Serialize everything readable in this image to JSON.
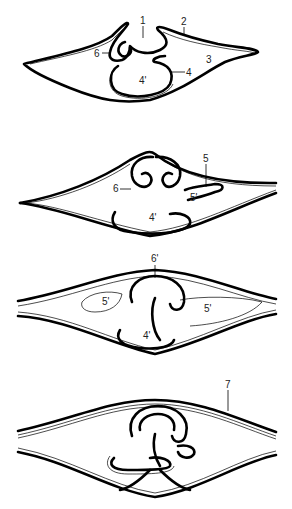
{
  "figure": {
    "panels": [
      {
        "id": "stage-1",
        "labels": [
          {
            "text": "1",
            "x": 142,
            "y": 24
          },
          {
            "text": "2",
            "x": 182,
            "y": 25
          },
          {
            "text": "3",
            "x": 206,
            "y": 63
          },
          {
            "text": "4",
            "x": 186,
            "y": 76
          },
          {
            "text": "4'",
            "x": 140,
            "y": 83
          },
          {
            "text": "6",
            "x": 95,
            "y": 57
          }
        ]
      },
      {
        "id": "stage-2",
        "labels": [
          {
            "text": "5",
            "x": 203,
            "y": 162
          },
          {
            "text": "6",
            "x": 113,
            "y": 192
          },
          {
            "text": "5'",
            "x": 191,
            "y": 200
          },
          {
            "text": "4'",
            "x": 149,
            "y": 220
          }
        ]
      },
      {
        "id": "stage-3",
        "labels": [
          {
            "text": "6'",
            "x": 152,
            "y": 262
          },
          {
            "text": "5'",
            "x": 103,
            "y": 305
          },
          {
            "text": "5'",
            "x": 204,
            "y": 312
          },
          {
            "text": "4'",
            "x": 144,
            "y": 339
          }
        ]
      },
      {
        "id": "stage-4",
        "labels": [
          {
            "text": "7",
            "x": 225,
            "y": 388
          }
        ]
      }
    ]
  }
}
